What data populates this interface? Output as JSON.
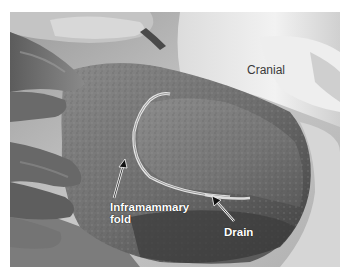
{
  "figure": {
    "type": "grayscale surgical photograph",
    "annotations": [
      {
        "id": "cranial",
        "text": "Cranial",
        "style": "dark regular text on light background",
        "arrow": false
      },
      {
        "id": "inframammary-fold",
        "text": "Inframammary\nfold",
        "lines": [
          "Inframammary",
          "fold"
        ],
        "style": "white bold text",
        "arrow": true
      },
      {
        "id": "drain",
        "text": "Drain",
        "style": "white bold text",
        "arrow": true
      }
    ]
  },
  "labels": {
    "cranial": "Cranial",
    "fold_line1": "Inframammary",
    "fold_line2": "fold",
    "drain": "Drain"
  },
  "colors": {
    "border": "#ffffff",
    "tissue_dark": "#4a4a4a",
    "tissue_mid": "#7a7a7a",
    "drape_light": "#e8e8e8",
    "label_light": "#ffffff",
    "label_dark": "#3a3a3a"
  }
}
